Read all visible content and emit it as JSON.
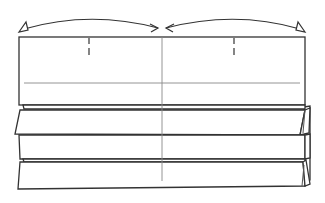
{
  "diagram": {
    "type": "origami-fold-diagram",
    "colors": {
      "stroke": "#333333",
      "thin_line": "#777777",
      "paper": "#ffffff",
      "background": "#ffffff"
    },
    "arrows": [
      {
        "name": "left-fold-arrow",
        "from": "left-edge",
        "to": "center",
        "head_at_start": "hollow-triangle",
        "head_at_end": "open-arrow"
      },
      {
        "name": "right-fold-arrow",
        "from": "right-edge",
        "to": "center",
        "head_at_start": "open-arrow",
        "head_at_end": "hollow-triangle"
      }
    ],
    "marks": {
      "center_crease": "vertical",
      "quarter_marks": [
        "left-quarter",
        "right-quarter"
      ],
      "horizontal_crease": "upper-panel"
    },
    "pleats": {
      "count": 4
    }
  }
}
